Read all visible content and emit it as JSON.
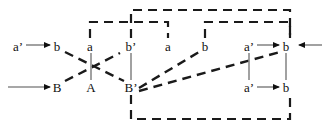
{
  "figure": {
    "width": 327,
    "height": 130,
    "background": "#ffffff",
    "colors": {
      "dashed_edge": "#1a1a1a",
      "bracket": "#1a1a1a",
      "connector": "#8a8a8a",
      "arrow_shaft": "#8a8a8a",
      "arrow_head": "#101010",
      "text": "#101010"
    }
  },
  "labels": {
    "top_row": [
      {
        "id": "b-left",
        "text": "b",
        "x": 57,
        "y": 46
      },
      {
        "id": "a-mid-left",
        "text": "a",
        "x": 90,
        "y": 46
      },
      {
        "id": "bprime-top",
        "text": "b’",
        "x": 131,
        "y": 46
      },
      {
        "id": "a-mid-right",
        "text": "a",
        "x": 168,
        "y": 46
      },
      {
        "id": "b-center",
        "text": "b",
        "x": 205,
        "y": 46
      },
      {
        "id": "aprime-top",
        "text": "a’",
        "x": 249,
        "y": 46
      },
      {
        "id": "b-right",
        "text": "b",
        "x": 286,
        "y": 46
      }
    ],
    "bottom_row": [
      {
        "id": "B-left",
        "text": "B",
        "x": 57,
        "y": 87
      },
      {
        "id": "A-mid",
        "text": "A",
        "x": 91,
        "y": 87
      },
      {
        "id": "Bprime-bottom",
        "text": "B’",
        "x": 131,
        "y": 87
      },
      {
        "id": "aprime-bottom",
        "text": "a’",
        "x": 249,
        "y": 87
      },
      {
        "id": "b-bottom",
        "text": "b",
        "x": 286,
        "y": 87
      }
    ],
    "left_inputs": [
      {
        "id": "aprime-input",
        "text": "a’",
        "x": 18,
        "y": 46
      }
    ]
  },
  "arrows": [
    {
      "id": "arrow-aprime-to-b-topleft",
      "x1": 26,
      "y1": 45,
      "x2": 50,
      "y2": 45,
      "dir": "right"
    },
    {
      "id": "arrow-into-B-bottomleft",
      "x1": 8,
      "y1": 87,
      "x2": 50,
      "y2": 87,
      "dir": "right"
    },
    {
      "id": "arrow-aprime-to-b-topright",
      "x1": 257,
      "y1": 45,
      "x2": 279,
      "y2": 45,
      "dir": "right"
    },
    {
      "id": "arrow-aprime-to-b-botright",
      "x1": 257,
      "y1": 87,
      "x2": 279,
      "y2": 87,
      "dir": "right"
    },
    {
      "id": "arrow-external-in-right",
      "x1": 322,
      "y1": 45,
      "x2": 299,
      "y2": 45,
      "dir": "left"
    }
  ],
  "connectors": [
    {
      "id": "connector-a-A",
      "x1": 91,
      "y1": 53,
      "x2": 91,
      "y2": 80
    },
    {
      "id": "connector-bprime-Bprime",
      "x1": 131,
      "y1": 53,
      "x2": 131,
      "y2": 80
    },
    {
      "id": "connector-aprime-vertical",
      "x1": 249,
      "y1": 53,
      "x2": 249,
      "y2": 80
    },
    {
      "id": "connector-b-right-vertical",
      "x1": 286,
      "y1": 53,
      "x2": 286,
      "y2": 80
    }
  ],
  "dashed_edges": [
    {
      "id": "edge-b-to-Bprime",
      "x1": 65,
      "y1": 52,
      "x2": 124,
      "y2": 81
    },
    {
      "id": "edge-B-to-a",
      "x1": 65,
      "y1": 81,
      "x2": 120,
      "y2": 53
    },
    {
      "id": "edge-Bprime-to-b-center",
      "x1": 139,
      "y1": 88,
      "x2": 199,
      "y2": 52
    },
    {
      "id": "edge-Bprime-to-b-right",
      "x1": 139,
      "y1": 91,
      "x2": 280,
      "y2": 52
    }
  ],
  "brackets": [
    {
      "id": "bracket-inner-left",
      "shape": "top",
      "left_x": 90,
      "right_x": 168,
      "stem_bottom_y": 38,
      "rail_y": 22
    },
    {
      "id": "bracket-outer-top",
      "shape": "top",
      "left_x": 131,
      "right_x": 290,
      "stem_bottom_y": 38,
      "rail_y": 10
    },
    {
      "id": "bracket-inner-right",
      "shape": "top",
      "left_x": 205,
      "right_x": 290,
      "stem_bottom_y": 38,
      "rail_y": 22
    },
    {
      "id": "bracket-bottom",
      "shape": "bottom",
      "left_x": 131,
      "right_x": 290,
      "stem_top_y": 95,
      "rail_y": 119
    }
  ]
}
